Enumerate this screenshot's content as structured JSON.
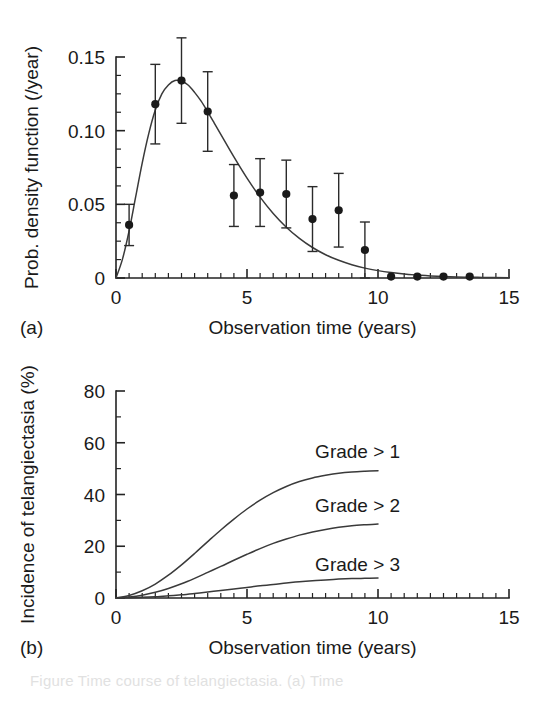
{
  "figure": {
    "background_color": "#ffffff",
    "ink_color": "#1a1a1a",
    "caption_partial": "Figure              Time course of telangiectasia. (a) Time"
  },
  "panel_a": {
    "label": "(a)"
  },
  "panel_b": {
    "label": "(b)"
  },
  "chart_data": [
    {
      "id": "panel-a",
      "type": "scatter",
      "title": "",
      "panel_label": "(a)",
      "xlabel": "Observation time (years)",
      "ylabel": "Prob. density function (/year)",
      "xlim": [
        0,
        15
      ],
      "ylim": [
        0,
        0.15
      ],
      "grid": false,
      "legend": "none",
      "x_ticks_major": [
        0,
        5,
        10,
        15
      ],
      "x_tick_labels": [
        "0",
        "5",
        "10",
        "15"
      ],
      "x_tick_minor_step": 0.5,
      "y_ticks_major": [
        0,
        0.05,
        0.1,
        0.15
      ],
      "y_tick_labels": [
        "0",
        "0.05",
        "0.10",
        "0.15"
      ],
      "y_tick_minor_step": 0.0125,
      "series": [
        {
          "name": "Observed probability density",
          "marker": "filled-circle",
          "error_bars": "vertical",
          "x": [
            0.5,
            1.5,
            2.5,
            3.5,
            4.5,
            5.5,
            6.5,
            7.5,
            8.5,
            9.5,
            10.5,
            11.5,
            12.5,
            13.5
          ],
          "y": [
            0.036,
            0.118,
            0.134,
            0.113,
            0.056,
            0.058,
            0.057,
            0.04,
            0.046,
            0.019,
            0.001,
            0.001,
            0.001,
            0.001
          ],
          "y_err_low": [
            0.014,
            0.027,
            0.029,
            0.027,
            0.021,
            0.023,
            0.023,
            0.022,
            0.025,
            0.019,
            0.0,
            0.0,
            0.0,
            0.0
          ],
          "y_err_high": [
            0.014,
            0.027,
            0.029,
            0.027,
            0.021,
            0.023,
            0.023,
            0.022,
            0.025,
            0.019,
            0.0,
            0.0,
            0.0,
            0.0
          ]
        },
        {
          "name": "Fitted density curve",
          "marker": "none",
          "line": "solid",
          "x": [
            0.0,
            0.25,
            0.5,
            0.75,
            1.0,
            1.25,
            1.5,
            1.75,
            2.0,
            2.25,
            2.5,
            2.75,
            3.0,
            3.25,
            3.5,
            3.75,
            4.0,
            4.5,
            5.0,
            5.5,
            6.0,
            6.5,
            7.0,
            7.5,
            8.0,
            8.5,
            9.0,
            9.5,
            10.0,
            10.5,
            11.0,
            11.5,
            12.0,
            13.0,
            14.0,
            15.0
          ],
          "y": [
            0.0,
            0.013,
            0.032,
            0.055,
            0.078,
            0.098,
            0.114,
            0.125,
            0.131,
            0.134,
            0.1335,
            0.131,
            0.126,
            0.12,
            0.1128,
            0.1052,
            0.0975,
            0.0822,
            0.0678,
            0.0549,
            0.0438,
            0.0345,
            0.0269,
            0.0207,
            0.0158,
            0.012,
            0.009,
            0.0067,
            0.005,
            0.0037,
            0.0027,
            0.002,
            0.0014,
            0.0007,
            0.0004,
            0.0002
          ]
        }
      ]
    },
    {
      "id": "panel-b",
      "type": "line",
      "title": "",
      "panel_label": "(b)",
      "xlabel": "Observation time (years)",
      "ylabel": "Incidence of telangiectasia (%)",
      "xlim": [
        0,
        15
      ],
      "ylim": [
        0,
        80
      ],
      "grid": false,
      "legend": "inline-labels",
      "x_ticks_major": [
        0,
        5,
        10,
        15
      ],
      "x_tick_labels": [
        "0",
        "5",
        "10",
        "15"
      ],
      "x_tick_minor_step": 0.5,
      "y_ticks_major": [
        0,
        20,
        40,
        60,
        80
      ],
      "y_tick_labels": [
        "0",
        "20",
        "40",
        "60",
        "80"
      ],
      "y_tick_minor_step": 10,
      "series": [
        {
          "name": "Grade > 1",
          "label": "Grade > 1",
          "label_x": 7.6,
          "label_y": 57,
          "x": [
            0,
            0.5,
            1,
            1.5,
            2,
            2.5,
            3,
            3.5,
            4,
            4.5,
            5,
            5.5,
            6,
            6.5,
            7,
            7.5,
            8,
            8.5,
            9,
            9.5,
            10
          ],
          "y": [
            0,
            1.0,
            2.8,
            5.4,
            8.8,
            12.8,
            17.2,
            21.8,
            26.3,
            30.5,
            34.4,
            37.8,
            40.7,
            43.1,
            45.0,
            46.4,
            47.4,
            48.2,
            48.7,
            49.0,
            49.2
          ]
        },
        {
          "name": "Grade > 2",
          "label": "Grade > 2",
          "label_x": 7.6,
          "label_y": 36,
          "x": [
            0,
            0.5,
            1,
            1.5,
            2,
            2.5,
            3,
            3.5,
            4,
            4.5,
            5,
            5.5,
            6,
            6.5,
            7,
            7.5,
            8,
            8.5,
            9,
            9.5,
            10
          ],
          "y": [
            0,
            0.4,
            1.1,
            2.2,
            3.7,
            5.5,
            7.6,
            9.9,
            12.2,
            14.6,
            16.9,
            19.1,
            21.1,
            22.8,
            24.3,
            25.5,
            26.5,
            27.3,
            27.9,
            28.3,
            28.6
          ]
        },
        {
          "name": "Grade > 3",
          "label": "Grade > 3",
          "label_x": 7.6,
          "label_y": 13,
          "x": [
            0,
            0.5,
            1,
            1.5,
            2,
            2.5,
            3,
            3.5,
            4,
            4.5,
            5,
            5.5,
            6,
            6.5,
            7,
            7.5,
            8,
            8.5,
            9,
            9.5,
            10
          ],
          "y": [
            0,
            0.1,
            0.25,
            0.5,
            0.85,
            1.25,
            1.75,
            2.3,
            2.9,
            3.5,
            4.1,
            4.7,
            5.2,
            5.8,
            6.3,
            6.7,
            7.0,
            7.3,
            7.5,
            7.6,
            7.7
          ]
        }
      ]
    }
  ]
}
